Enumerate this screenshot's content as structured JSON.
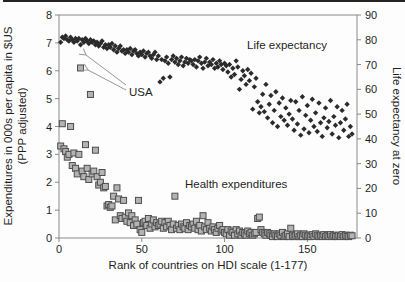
{
  "figure": {
    "background": "#fdfdfd",
    "top_rule_color": "#242424",
    "frame_color": "#8a8a8a",
    "arrow_color": "#979797"
  },
  "chart_data": {
    "type": "scatter",
    "title": "",
    "xlabel": "Rank of countries on HDI scale (1-177)",
    "ylabel_left_lines": [
      "Expenditures in 000s per capita in $US",
      "(PPP adjusted)"
    ],
    "ylabel_right": "Life expectancy at zero",
    "xlim": [
      0,
      180
    ],
    "ylim_left": [
      0,
      8
    ],
    "ylim_right": [
      0,
      90
    ],
    "x_ticks": [
      0,
      50,
      100,
      150
    ],
    "y_ticks_left": [
      0,
      1,
      2,
      3,
      4,
      5,
      6,
      7,
      8
    ],
    "y_ticks_right": [
      0,
      10,
      20,
      30,
      40,
      50,
      60,
      70,
      80,
      90
    ],
    "grid": false,
    "legend": "none (in-plot text labels)",
    "x_meaning": "HDI rank, 1 to 177, one point per rank",
    "series": [
      {
        "name": "Life expectancy",
        "marker": "diamond",
        "color": "#2b2b2b",
        "axis": "right",
        "x_start": 1,
        "values": [
          79,
          81,
          80.5,
          81.5,
          80,
          79.5,
          81,
          80,
          79,
          80.5,
          79.5,
          80.5,
          78,
          80,
          79,
          80.5,
          79.5,
          78.5,
          80,
          79,
          79.5,
          78,
          79,
          77.5,
          78.5,
          79.5,
          77,
          78,
          76.5,
          78,
          77,
          78.5,
          76,
          77.5,
          75,
          76.5,
          77.5,
          75.5,
          76,
          74.5,
          76,
          75,
          76.5,
          74,
          75.5,
          76,
          74.5,
          73.5,
          75,
          74,
          75.5,
          73,
          74.5,
          75,
          73.5,
          72.5,
          74,
          75,
          72,
          73.5,
          63,
          72,
          64.5,
          71.5,
          73,
          70.5,
          65,
          72,
          73.5,
          71,
          72.5,
          70,
          71.5,
          73,
          69.5,
          71,
          72.5,
          70.5,
          72,
          71.5,
          70,
          72,
          69,
          71.5,
          73,
          70.5,
          68.5,
          71,
          72.5,
          69.5,
          71,
          70,
          72,
          68.5,
          70.5,
          69,
          71.5,
          70,
          68,
          70.5,
          69.5,
          67,
          70,
          65,
          68.5,
          66,
          71.5,
          69,
          60,
          64,
          67.5,
          65.5,
          62,
          68,
          63.5,
          66.5,
          52,
          61,
          64.5,
          55,
          50.5,
          53,
          58,
          51,
          62,
          48.5,
          54,
          57.5,
          46.5,
          51.5,
          59,
          45,
          54.5,
          49,
          56.5,
          47.5,
          52.5,
          45.5,
          50,
          55.5,
          48,
          43.5,
          55,
          46,
          51.5,
          41.5,
          57,
          44,
          49.5,
          53.5,
          42.5,
          47.5,
          56,
          45,
          50.5,
          43,
          54.5,
          46.5,
          41,
          48.5,
          52.5,
          44.5,
          47,
          55.5,
          42,
          49,
          45.5,
          53,
          40.5,
          46.5,
          51.5,
          43.5,
          48,
          54,
          41,
          45,
          42
        ]
      },
      {
        "name": "Health expenditures",
        "marker": "square",
        "color": "#b3b3b3",
        "stroke": "#4d4d4d",
        "axis": "left",
        "x_start": 1,
        "values": [
          3.3,
          4.1,
          3.2,
          3.1,
          2.9,
          3.0,
          4.0,
          2.6,
          3.05,
          2.5,
          2.3,
          3.0,
          6.1,
          2.4,
          2.2,
          3.35,
          2.5,
          2.1,
          5.15,
          2.3,
          2.4,
          3.15,
          2.2,
          1.9,
          2.0,
          2.35,
          1.8,
          1.85,
          1.15,
          1.2,
          1.1,
          1.15,
          1.5,
          0.65,
          1.8,
          1.4,
          0.8,
          0.7,
          1.35,
          0.75,
          0.6,
          0.9,
          0.55,
          0.8,
          0.45,
          0.65,
          0.5,
          1.35,
          0.3,
          0.2,
          0.55,
          0.6,
          0.45,
          0.7,
          0.35,
          0.5,
          0.65,
          0.4,
          0.55,
          0.45,
          0.5,
          0.6,
          0.35,
          0.55,
          0.4,
          0.6,
          0.45,
          0.3,
          0.5,
          1.5,
          0.35,
          0.45,
          0.3,
          0.5,
          0.4,
          0.35,
          0.55,
          0.3,
          0.45,
          0.4,
          0.5,
          0.35,
          0.6,
          0.3,
          0.45,
          0.25,
          0.8,
          0.4,
          0.3,
          0.55,
          0.35,
          0.25,
          0.4,
          0.3,
          0.2,
          0.35,
          0.45,
          0.25,
          0.3,
          0.2,
          0.15,
          0.3,
          0.1,
          0.25,
          0.2,
          0.1,
          0.3,
          0.15,
          0.25,
          0.1,
          0.2,
          0.15,
          0.1,
          0.25,
          0.15,
          0.2,
          0.1,
          0.15,
          0.2,
          0.7,
          0.75,
          0.3,
          0.2,
          0.15,
          0.1,
          0.2,
          0.15,
          0.1,
          0.05,
          0.15,
          0.1,
          0.05,
          0.15,
          0.1,
          0.2,
          0.05,
          0.1,
          0.15,
          0.05,
          0.35,
          0.1,
          0.05,
          0.1,
          0.15,
          0.05,
          0.1,
          0.05,
          0.15,
          0.1,
          0.05,
          0.1,
          0.05,
          0.12,
          0.06,
          0.15,
          0.1,
          0.05,
          0.1,
          0.06,
          0.12,
          0.05,
          0.1,
          0.06,
          0.12,
          0.05,
          0.1,
          0.06,
          0.05,
          0.1,
          0.06,
          0.12,
          0.05,
          0.1,
          0.06,
          0.05,
          0.1,
          0.08
        ]
      }
    ],
    "notable_points": {
      "usa_health_expenditure": {
        "rank": 13,
        "value_thousands_usd": 6.1
      },
      "luxembourg_like_outlier": {
        "rank": 19,
        "value_thousands_usd": 5.15
      }
    },
    "annotations": {
      "life_label": {
        "text": "Life expectancy",
        "px": [
          247,
          49
        ]
      },
      "health_label": {
        "text": "Health expenditures",
        "px": [
          185,
          188
        ]
      },
      "usa_label": {
        "text": "USA",
        "px": [
          129,
          96
        ]
      },
      "usa_arrows": [
        {
          "x1": 126,
          "y1": 85,
          "x2": 86,
          "y2": 55
        },
        {
          "x1": 126,
          "y1": 90,
          "x2": 88,
          "y2": 70
        }
      ]
    }
  }
}
